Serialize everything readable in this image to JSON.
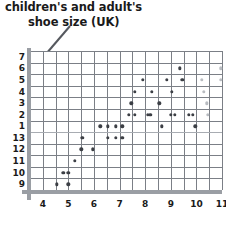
{
  "title": {
    "line1": "children's and adult's",
    "line2": "shoe size (UK)"
  },
  "annotation": {
    "arrow_name": "title-pointer-arrow"
  },
  "chart_data": {
    "type": "scatter",
    "title": "children's and adult's shoe size (UK)",
    "xlabel": "",
    "ylabel": "children's and adult's shoe size (UK)",
    "grid": true,
    "legend": "none",
    "xlim": [
      3.5,
      11.5
    ],
    "x_tick_labels": [
      "4",
      "5",
      "6",
      "7",
      "8",
      "9",
      "10",
      "11"
    ],
    "x_ticks": [
      4,
      5,
      6,
      7,
      8,
      9,
      10,
      11
    ],
    "y_tick_labels": [
      "7",
      "6",
      "5",
      "4",
      "3",
      "2",
      "1",
      "13",
      "12",
      "11",
      "10",
      "9"
    ],
    "y_axis_note": "wrapped shoe-size scale: children's 9-13 at bottom, adult's 1-7 above",
    "y_scale_order_top_to_bottom": [
      7,
      6,
      5,
      4,
      3,
      2,
      1,
      13,
      12,
      11,
      10,
      9
    ],
    "points": [
      {
        "x": 4.55,
        "y_label": "9",
        "row": 11
      },
      {
        "x": 4.8,
        "y_label": "10",
        "row": 10
      },
      {
        "x": 5.0,
        "y_label": "9",
        "row": 11
      },
      {
        "x": 5.0,
        "y_label": "10",
        "row": 10
      },
      {
        "x": 5.25,
        "y_label": "11",
        "row": 9
      },
      {
        "x": 5.5,
        "y_label": "12",
        "row": 8
      },
      {
        "x": 5.55,
        "y_label": "13",
        "row": 7
      },
      {
        "x": 5.95,
        "y_label": "12",
        "row": 8
      },
      {
        "x": 6.25,
        "y_label": "1",
        "row": 6
      },
      {
        "x": 6.55,
        "y_label": "1",
        "row": 6
      },
      {
        "x": 6.55,
        "y_label": "13",
        "row": 7
      },
      {
        "x": 6.85,
        "y_label": "1",
        "row": 6
      },
      {
        "x": 6.85,
        "y_label": "13",
        "row": 7
      },
      {
        "x": 7.1,
        "y_label": "1",
        "row": 6
      },
      {
        "x": 7.1,
        "y_label": "13",
        "row": 7
      },
      {
        "x": 7.35,
        "y_label": "2",
        "row": 5
      },
      {
        "x": 7.45,
        "y_label": "3",
        "row": 4
      },
      {
        "x": 7.6,
        "y_label": "2",
        "row": 5
      },
      {
        "x": 7.6,
        "y_label": "4",
        "row": 3
      },
      {
        "x": 7.9,
        "y_label": "5",
        "row": 2
      },
      {
        "x": 8.1,
        "y_label": "2",
        "row": 5
      },
      {
        "x": 8.2,
        "y_label": "2",
        "row": 5
      },
      {
        "x": 8.25,
        "y_label": "4",
        "row": 3
      },
      {
        "x": 8.55,
        "y_label": "3",
        "row": 4
      },
      {
        "x": 8.65,
        "y_label": "1",
        "row": 6
      },
      {
        "x": 8.85,
        "y_label": "5",
        "row": 2
      },
      {
        "x": 9.0,
        "y_label": "2",
        "row": 5
      },
      {
        "x": 9.05,
        "y_label": "4",
        "row": 3
      },
      {
        "x": 9.15,
        "y_label": "2",
        "row": 5
      },
      {
        "x": 9.35,
        "y_label": "6",
        "row": 1
      },
      {
        "x": 9.45,
        "y_label": "5",
        "row": 2
      },
      {
        "x": 9.7,
        "y_label": "2",
        "row": 5
      },
      {
        "x": 9.85,
        "y_label": "2",
        "row": 5
      },
      {
        "x": 9.95,
        "y_label": "1",
        "row": 6
      },
      {
        "x": 10.2,
        "y_label": "5",
        "row": 2,
        "faded": true
      },
      {
        "x": 10.3,
        "y_label": "4",
        "row": 3,
        "faded": true
      },
      {
        "x": 10.4,
        "y_label": "3",
        "row": 4,
        "faded": true
      },
      {
        "x": 10.45,
        "y_label": "2",
        "row": 5,
        "faded": true
      },
      {
        "x": 10.95,
        "y_label": "6",
        "row": 1,
        "faded": true
      },
      {
        "x": 10.95,
        "y_label": "5",
        "row": 2,
        "faded": true
      }
    ]
  }
}
